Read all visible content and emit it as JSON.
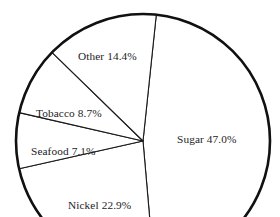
{
  "chart_data": {
    "type": "pie",
    "title": "",
    "subtitle": "",
    "xlabel": "",
    "ylabel": "",
    "legend": "none",
    "grid": false,
    "labels_inline": true,
    "start_angle_deg": -84,
    "direction": "clockwise",
    "categories": [
      "Sugar",
      "Nickel",
      "Seafood",
      "Tobacco",
      "Other"
    ],
    "values": [
      47.0,
      22.9,
      7.1,
      8.7,
      14.4
    ],
    "unit": "%",
    "slices": [
      {
        "name": "Sugar",
        "value": 47.0,
        "label": "Sugar 47.0%",
        "percent_text": "47.0%",
        "fill": "#ffffff",
        "stroke": "#1a1a1a"
      },
      {
        "name": "Nickel",
        "value": 22.9,
        "label": "Nickel 22.9%",
        "percent_text": "22.9%",
        "fill": "#ffffff",
        "stroke": "#1a1a1a"
      },
      {
        "name": "Seafood",
        "value": 7.1,
        "label": "Seafood 7.1%",
        "percent_text": "7.1%",
        "fill": "#ffffff",
        "stroke": "#1a1a1a"
      },
      {
        "name": "Tobacco",
        "value": 8.7,
        "label": "Tobacco 8.7%",
        "percent_text": "8.7%",
        "fill": "#ffffff",
        "stroke": "#1a1a1a"
      },
      {
        "name": "Other",
        "value": 14.4,
        "label": "Other 14.4%",
        "percent_text": "14.4%",
        "fill": "#ffffff",
        "stroke": "#1a1a1a"
      }
    ],
    "total": 100.1,
    "colors": {
      "background": "#ffffff",
      "outline": "#111111",
      "divider": "#1a1a1a",
      "text": "#1d1d1d"
    }
  }
}
